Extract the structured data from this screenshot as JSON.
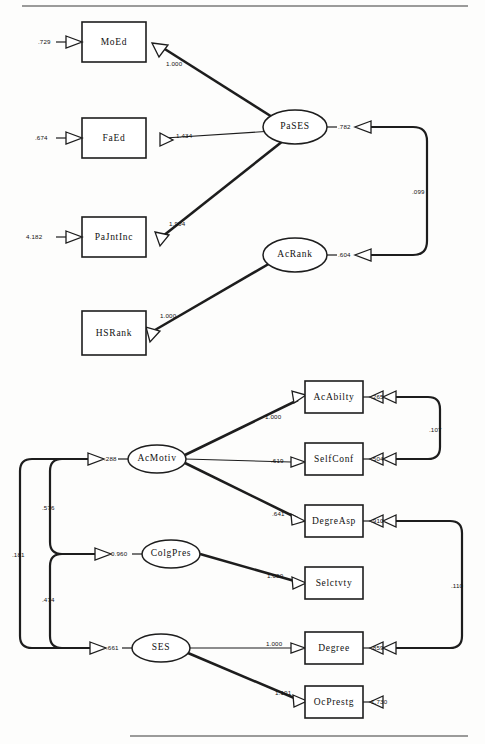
{
  "diagram": {
    "type": "sem-path-diagram",
    "panels": [
      {
        "id": "top-panel",
        "name": "Parental SES and Academic Rank Measurement Model",
        "observed_variables": [
          {
            "id": "MoEd",
            "label": "MoEd",
            "error_value": ".729"
          },
          {
            "id": "FaEd",
            "label": "FaEd",
            "error_value": ".674"
          },
          {
            "id": "PaJntInc",
            "label": "PaJntInc",
            "error_value": "4.182"
          },
          {
            "id": "HSRank",
            "label": "HSRank",
            "error_value": ""
          }
        ],
        "latent_variables": [
          {
            "id": "PaSES",
            "label": "PaSES",
            "disturbance_value": ".782"
          },
          {
            "id": "AcRank",
            "label": "AcRank",
            "disturbance_value": ".604"
          }
        ],
        "loadings": [
          {
            "from": "PaSES",
            "to": "MoEd",
            "value": "1.000"
          },
          {
            "from": "PaSES",
            "to": "FaEd",
            "value": "1.434"
          },
          {
            "from": "PaSES",
            "to": "PaJntInc",
            "value": "1.904"
          },
          {
            "from": "AcRank",
            "to": "HSRank",
            "value": "1.000"
          }
        ],
        "covariances": [
          {
            "between": [
              "PaSES",
              "AcRank"
            ],
            "value": ".099"
          }
        ]
      },
      {
        "id": "bottom-panel",
        "name": "Academic Motivation, College Prestige and SES Measurement Model",
        "observed_variables": [
          {
            "id": "AcAbilty",
            "label": "AcAbilty",
            "error_value": ".265"
          },
          {
            "id": "SelfConf",
            "label": "SelfConf",
            "error_value": ".504"
          },
          {
            "id": "DegreAsp",
            "label": "DegreAsp",
            "error_value": ".910"
          },
          {
            "id": "Selctvty",
            "label": "Selctvty",
            "error_value": ""
          },
          {
            "id": "Degree",
            "label": "Degree",
            "error_value": ".859"
          },
          {
            "id": "OcPrestg",
            "label": "OcPrestg",
            "error_value": "1.730"
          }
        ],
        "latent_variables": [
          {
            "id": "AcMotiv",
            "label": "AcMotiv",
            "disturbance_value": ".288"
          },
          {
            "id": "ColgPres",
            "label": "ColgPres",
            "disturbance_value": "0.960"
          },
          {
            "id": "SES",
            "label": "SES",
            "disturbance_value": ".661"
          }
        ],
        "loadings": [
          {
            "from": "AcMotiv",
            "to": "AcAbilty",
            "value": "1.000"
          },
          {
            "from": "AcMotiv",
            "to": "SelfConf",
            "value": ".619"
          },
          {
            "from": "AcMotiv",
            "to": "DegreAsp",
            "value": ".641"
          },
          {
            "from": "ColgPres",
            "to": "Selctvty",
            "value": "1.000"
          },
          {
            "from": "SES",
            "to": "Degree",
            "value": "1.000"
          },
          {
            "from": "SES",
            "to": "OcPrestg",
            "value": "1.101"
          }
        ],
        "covariances": [
          {
            "between": [
              "AcMotiv",
              "ColgPres"
            ],
            "value": ".576"
          },
          {
            "between": [
              "ColgPres",
              "SES"
            ],
            "value": ".474"
          },
          {
            "between": [
              "AcMotiv",
              "SES"
            ],
            "value": ".181"
          },
          {
            "between": [
              "AcAbilty",
              "SelfConf"
            ],
            "value": ".107"
          },
          {
            "between": [
              "DegreAsp",
              "Degree"
            ],
            "value": ".110"
          }
        ]
      }
    ]
  },
  "colors": {
    "stroke": "#1d1d1d",
    "fill": "#ffffff",
    "background": "#fdfdfc",
    "rule": "#7a7a7a"
  }
}
